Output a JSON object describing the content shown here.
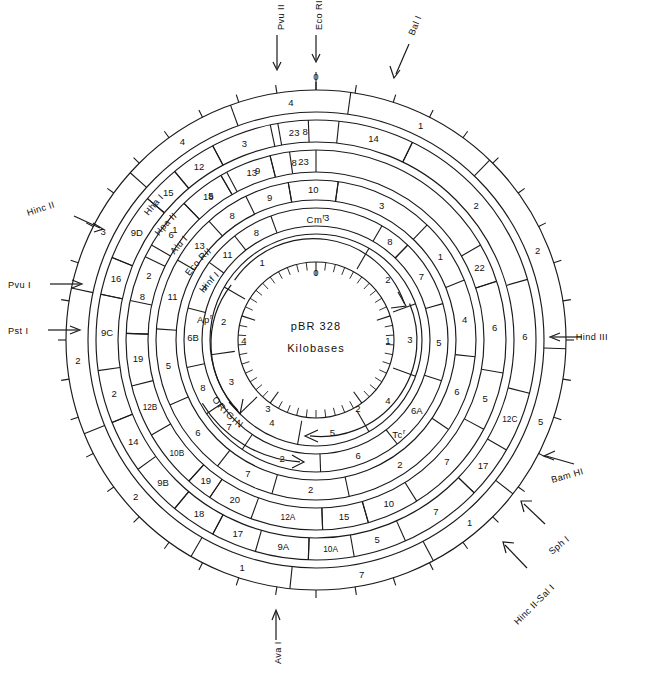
{
  "figure": {
    "center_label_line1": "pBR 328",
    "center_label_line2": "Kilobases",
    "center_scale_ticks": [
      "0",
      "1",
      "2",
      "3",
      "4"
    ],
    "origin_label": "ORIGIN",
    "genes": [
      {
        "name": "Cmr",
        "label": "Cm",
        "sup": "r",
        "direction": "clockwise"
      },
      {
        "name": "Apr",
        "label": "Ap",
        "sup": "r",
        "direction": "clockwise"
      },
      {
        "name": "Tcr",
        "label": "Tc",
        "sup": "r",
        "direction": "counter-clockwise"
      }
    ]
  },
  "outer_pointers": [
    {
      "id": "pvu2",
      "label": "Pvu II",
      "position": "top"
    },
    {
      "id": "ecori",
      "label": "Eco RI",
      "position": "top"
    },
    {
      "id": "bal1",
      "label": "Bal I",
      "position": "top-right"
    },
    {
      "id": "hind3",
      "label": "Hind III",
      "position": "right"
    },
    {
      "id": "bamh1",
      "label": "Bam HI",
      "position": "right-lower"
    },
    {
      "id": "sph1",
      "label": "Sph I",
      "position": "lower-right"
    },
    {
      "id": "hinc2-sal1",
      "label": "Hinc II-Sal I",
      "position": "lower-right"
    },
    {
      "id": "ava1",
      "label": "Ava I",
      "position": "bottom"
    },
    {
      "id": "pst1",
      "label": "Pst I",
      "position": "left"
    },
    {
      "id": "pvu1",
      "label": "Pvu I",
      "position": "left"
    },
    {
      "id": "hinc2",
      "label": "Hinc II",
      "position": "upper-left"
    }
  ],
  "ring_enzyme_labels": [
    {
      "ring": 2,
      "label": "Hha I"
    },
    {
      "ring": 3,
      "label": "Hpa II"
    },
    {
      "ring": 4,
      "label": "Alu I"
    },
    {
      "ring": 5,
      "label": "Eco RII"
    },
    {
      "ring": 6,
      "label": "Hinf I"
    }
  ],
  "zero_tick_label": "0",
  "rings": [
    {
      "index": 1,
      "name": "outer-scale-ring",
      "fragments": [
        {
          "label": "1",
          "start": 8,
          "end": 44
        },
        {
          "label": "2",
          "start": 44,
          "end": 92
        },
        {
          "label": "5",
          "start": 92,
          "end": 128
        },
        {
          "label": "1",
          "start": 128,
          "end": 152
        },
        {
          "label": "7",
          "start": 152,
          "end": 186
        },
        {
          "label": "1",
          "start": 186,
          "end": 210
        },
        {
          "label": "2",
          "start": 210,
          "end": 248
        },
        {
          "label": "2",
          "start": 248,
          "end": 282
        },
        {
          "label": "3",
          "start": 282,
          "end": 312
        },
        {
          "label": "4",
          "start": 312,
          "end": 340
        },
        {
          "label": "4",
          "start": 340,
          "end": 8
        }
      ]
    },
    {
      "index": 2,
      "name": "hha1-ring",
      "enzyme": "Hha I",
      "fragments": [
        {
          "label": "14",
          "start": 6,
          "end": 26,
          "boxed": true
        },
        {
          "label": "2",
          "start": 26,
          "end": 74
        },
        {
          "label": "6",
          "start": 74,
          "end": 104
        },
        {
          "label": "12C",
          "start": 104,
          "end": 120,
          "boxed": false
        },
        {
          "label": "17",
          "start": 120,
          "end": 134,
          "boxed": true
        },
        {
          "label": "7",
          "start": 134,
          "end": 156
        },
        {
          "label": "5",
          "start": 156,
          "end": 170
        },
        {
          "label": "10A",
          "start": 170,
          "end": 182,
          "boxed": true
        },
        {
          "label": "9A",
          "start": 182,
          "end": 196,
          "boxed": false
        },
        {
          "label": "17",
          "start": 196,
          "end": 208,
          "boxed": true
        },
        {
          "label": "18",
          "start": 208,
          "end": 220,
          "boxed": true
        },
        {
          "label": "9B",
          "start": 220,
          "end": 234
        },
        {
          "label": "14",
          "start": 234,
          "end": 248,
          "boxed": true
        },
        {
          "label": "2",
          "start": 248,
          "end": 262
        },
        {
          "label": "9C",
          "start": 262,
          "end": 282,
          "boxed": true
        },
        {
          "label": "16",
          "start": 282,
          "end": 292,
          "boxed": true
        },
        {
          "label": "9D",
          "start": 292,
          "end": 310,
          "boxed": true
        },
        {
          "label": "15",
          "start": 310,
          "end": 320,
          "boxed": true
        },
        {
          "label": "12",
          "start": 320,
          "end": 332,
          "boxed": true
        },
        {
          "label": "3",
          "start": 332,
          "end": 348
        },
        {
          "label": "8",
          "start": 348,
          "end": 6
        },
        {
          "label": "23",
          "start": 350,
          "end": 358,
          "boxed": true
        }
      ]
    },
    {
      "index": 3,
      "name": "hpa2-ring",
      "enzyme": "Hpa II",
      "fragments": [
        {
          "label": "23",
          "start": 352,
          "end": 360,
          "boxed": true
        },
        {
          "label": "9",
          "start": 330,
          "end": 352
        },
        {
          "label": "18",
          "start": 316,
          "end": 330,
          "boxed": true
        },
        {
          "label": "1",
          "start": 300,
          "end": 316
        },
        {
          "label": "2",
          "start": 282,
          "end": 300
        },
        {
          "label": "22",
          "start": 60,
          "end": 72,
          "boxed": true
        },
        {
          "label": "6",
          "start": 72,
          "end": 100
        },
        {
          "label": "5",
          "start": 100,
          "end": 118
        },
        {
          "label": "7",
          "start": 118,
          "end": 148
        },
        {
          "label": "10",
          "start": 148,
          "end": 164,
          "boxed": true
        },
        {
          "label": "15",
          "start": 164,
          "end": 178,
          "boxed": true
        },
        {
          "label": "12A",
          "start": 178,
          "end": 200
        },
        {
          "label": "20",
          "start": 200,
          "end": 214,
          "boxed": true
        },
        {
          "label": "19",
          "start": 214,
          "end": 222,
          "boxed": true
        },
        {
          "label": "10B",
          "start": 222,
          "end": 240,
          "boxed": false
        },
        {
          "label": "12B",
          "start": 240,
          "end": 256
        },
        {
          "label": "19",
          "start": 256,
          "end": 272,
          "boxed": true
        },
        {
          "label": "8",
          "start": 272,
          "end": 296
        },
        {
          "label": "6",
          "start": 296,
          "end": 316
        },
        {
          "label": "5",
          "start": 316,
          "end": 332
        },
        {
          "label": "13",
          "start": 332,
          "end": 346,
          "boxed": true
        },
        {
          "label": "8",
          "start": 346,
          "end": 360
        }
      ]
    },
    {
      "index": 4,
      "name": "alu1-ring",
      "enzyme": "Alu I",
      "fragments": [
        {
          "label": "10",
          "start": 350,
          "end": 8,
          "boxed": true
        },
        {
          "label": "9",
          "start": 334,
          "end": 350,
          "boxed": true
        },
        {
          "label": "3",
          "start": 8,
          "end": 44
        },
        {
          "label": "1",
          "start": 44,
          "end": 68
        },
        {
          "label": "4",
          "start": 68,
          "end": 96
        },
        {
          "label": "6",
          "start": 96,
          "end": 124
        },
        {
          "label": "2",
          "start": 124,
          "end": 168
        },
        {
          "label": "2",
          "start": 168,
          "end": 196
        },
        {
          "label": "7",
          "start": 196,
          "end": 218
        },
        {
          "label": "6",
          "start": 218,
          "end": 246
        },
        {
          "label": "5",
          "start": 246,
          "end": 274
        },
        {
          "label": "11",
          "start": 274,
          "end": 300
        },
        {
          "label": "13",
          "start": 300,
          "end": 318
        },
        {
          "label": "8",
          "start": 318,
          "end": 334
        }
      ]
    },
    {
      "index": 5,
      "name": "ecorii-ring",
      "enzyme": "Eco RII",
      "fragments": [
        {
          "label": "3",
          "start": 340,
          "end": 30
        },
        {
          "label": "8",
          "start": 30,
          "end": 44,
          "boxed": true
        },
        {
          "label": "7",
          "start": 44,
          "end": 74
        },
        {
          "label": "5",
          "start": 74,
          "end": 108
        },
        {
          "label": "6A",
          "start": 108,
          "end": 142
        },
        {
          "label": "6",
          "start": 142,
          "end": 178
        },
        {
          "label": "2",
          "start": 178,
          "end": 214
        },
        {
          "label": "7",
          "start": 214,
          "end": 236
        },
        {
          "label": "8",
          "start": 236,
          "end": 258
        },
        {
          "label": "6B",
          "start": 258,
          "end": 284
        },
        {
          "label": "4",
          "start": 284,
          "end": 306
        },
        {
          "label": "11",
          "start": 306,
          "end": 322
        },
        {
          "label": "8",
          "start": 322,
          "end": 340
        }
      ]
    },
    {
      "index": 6,
      "name": "hinf1-ring",
      "enzyme": "Hinf I",
      "fragments": [
        {
          "label": "1",
          "start": 300,
          "end": 350
        },
        {
          "label": "2",
          "start": 262,
          "end": 300
        },
        {
          "label": "3",
          "start": 226,
          "end": 262
        },
        {
          "label": "4",
          "start": 190,
          "end": 226
        },
        {
          "label": "5",
          "start": 150,
          "end": 190
        },
        {
          "label": "4",
          "start": 110,
          "end": 150
        },
        {
          "label": "3",
          "start": 70,
          "end": 110
        },
        {
          "label": "2",
          "start": 30,
          "end": 70
        }
      ]
    }
  ]
}
